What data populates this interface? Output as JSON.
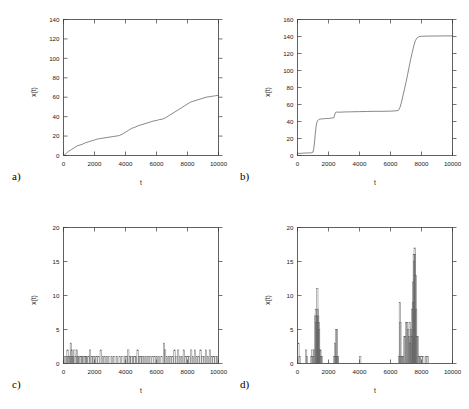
{
  "figure": {
    "panel_labels": [
      "a)",
      "b)",
      "c)",
      "d)"
    ]
  },
  "chart_data": [
    {
      "panel": "a)",
      "type": "line",
      "title": "",
      "xlabel": "t",
      "ylabel": "x(t)",
      "xlim": [
        0,
        10000
      ],
      "ylim": [
        0,
        140
      ],
      "xticks": [
        0,
        2000,
        4000,
        6000,
        8000,
        10000
      ],
      "yticks": [
        0,
        20,
        40,
        60,
        80,
        100,
        120,
        140
      ],
      "xtick_labels": [
        "0",
        "2000",
        "4000",
        "6000",
        "8000",
        "10000"
      ],
      "ytick_labels": [
        "0",
        "20",
        "40",
        "60",
        "80",
        "100",
        "120",
        "140"
      ],
      "grid": false,
      "legend": false,
      "series": [
        {
          "name": "x(t)",
          "color": "#555555",
          "x": [
            0,
            100,
            200,
            300,
            400,
            500,
            600,
            700,
            800,
            900,
            1000,
            1200,
            1400,
            1600,
            1800,
            2000,
            2200,
            2400,
            2600,
            2800,
            3000,
            3200,
            3400,
            3600,
            3800,
            4000,
            4200,
            4400,
            4600,
            4800,
            5000,
            5200,
            5400,
            5600,
            5800,
            6000,
            6200,
            6400,
            6600,
            6800,
            7000,
            7200,
            7400,
            7600,
            7800,
            8000,
            8200,
            8400,
            8600,
            8800,
            9000,
            9200,
            9400,
            9600,
            9800,
            10000
          ],
          "y": [
            0,
            1,
            2.5,
            4,
            5,
            6,
            7,
            8,
            9,
            10,
            10.5,
            11.5,
            13,
            14,
            15,
            16,
            17,
            17.5,
            18,
            18.5,
            19,
            19.5,
            20,
            20.5,
            22,
            24,
            26,
            28,
            29,
            30.5,
            31.5,
            32.5,
            33.5,
            34.5,
            35.5,
            36,
            37,
            37.5,
            39,
            41,
            43,
            45,
            47,
            49,
            51,
            53,
            55,
            56,
            57,
            58,
            59,
            60,
            60.5,
            61,
            61.5,
            62
          ]
        }
      ]
    },
    {
      "panel": "b)",
      "type": "line",
      "title": "",
      "xlabel": "t",
      "ylabel": "x(t)",
      "xlim": [
        0,
        10000
      ],
      "ylim": [
        0,
        160
      ],
      "xticks": [
        0,
        2000,
        4000,
        6000,
        8000,
        10000
      ],
      "yticks": [
        0,
        20,
        40,
        60,
        80,
        100,
        120,
        140,
        160
      ],
      "xtick_labels": [
        "0",
        "2000",
        "4000",
        "6000",
        "8000",
        "10000"
      ],
      "ytick_labels": [
        "0",
        "20",
        "40",
        "60",
        "80",
        "100",
        "120",
        "140",
        "160"
      ],
      "grid": false,
      "legend": false,
      "series": [
        {
          "name": "x(t)",
          "color": "#555555",
          "x": [
            0,
            200,
            400,
            600,
            800,
            900,
            1000,
            1050,
            1100,
            1150,
            1200,
            1250,
            1300,
            1350,
            1400,
            1450,
            1500,
            1600,
            1800,
            2000,
            2200,
            2350,
            2400,
            2450,
            2500,
            2600,
            2800,
            3000,
            3500,
            4000,
            4500,
            5000,
            5500,
            6000,
            6300,
            6500,
            6600,
            6700,
            6800,
            6900,
            7000,
            7100,
            7200,
            7300,
            7400,
            7500,
            7600,
            7700,
            7800,
            7900,
            8000,
            8200,
            8500,
            9000,
            9500,
            10000
          ],
          "y": [
            2.5,
            2.5,
            2.8,
            3,
            3,
            3.2,
            4,
            8,
            16,
            26,
            34,
            39,
            41,
            42,
            42.5,
            43,
            43,
            43,
            43.5,
            43.5,
            44,
            44.5,
            48,
            50.5,
            51,
            51,
            51,
            51.2,
            51.4,
            51.6,
            51.8,
            52,
            52,
            52.2,
            52.5,
            53,
            56,
            62,
            70,
            78,
            86,
            95,
            104,
            113,
            121,
            129,
            135,
            138,
            139.5,
            140,
            140.2,
            140.4,
            140.5,
            140.6,
            140.7,
            140.8
          ]
        }
      ]
    },
    {
      "panel": "c)",
      "type": "bar",
      "title": "",
      "xlabel": "t",
      "ylabel": "x(t)",
      "xlim": [
        0,
        10000
      ],
      "ylim": [
        0,
        20
      ],
      "xticks": [
        0,
        2000,
        4000,
        6000,
        8000,
        10000
      ],
      "yticks": [
        0,
        5,
        10,
        15,
        20
      ],
      "xtick_labels": [
        "0",
        "2000",
        "4000",
        "6000",
        "8000",
        "10000"
      ],
      "ytick_labels": [
        "0",
        "5",
        "10",
        "15",
        "20"
      ],
      "grid": false,
      "legend": false,
      "bar_color": "#5a5a5a",
      "x": [
        120,
        200,
        260,
        330,
        400,
        470,
        520,
        570,
        620,
        700,
        780,
        860,
        940,
        1020,
        1100,
        1180,
        1280,
        1360,
        1440,
        1520,
        1620,
        1720,
        1820,
        1920,
        2020,
        2140,
        2260,
        2400,
        2540,
        2660,
        2800,
        2960,
        3120,
        3280,
        3440,
        3620,
        3800,
        3980,
        4080,
        4180,
        4280,
        4380,
        4480,
        4580,
        4680,
        4780,
        4880,
        4980,
        5080,
        5200,
        5320,
        5460,
        5600,
        5740,
        5880,
        6020,
        6160,
        6320,
        6480,
        6560,
        6680,
        6800,
        6920,
        7040,
        7160,
        7280,
        7400,
        7520,
        7640,
        7760,
        7880,
        8000,
        8120,
        8240,
        8360,
        8480,
        8600,
        8720,
        8840,
        8960,
        9080,
        9200,
        9320,
        9440,
        9560,
        9680,
        9800,
        9900
      ],
      "values": [
        1,
        1,
        2,
        1,
        1,
        3,
        2,
        1,
        1,
        2,
        1,
        2,
        1,
        1,
        1,
        1,
        1,
        1,
        1,
        1,
        1,
        2,
        1,
        1,
        1,
        1,
        1,
        2,
        1,
        1,
        1,
        1,
        1,
        1,
        1,
        1,
        1,
        1,
        1,
        2,
        1,
        1,
        1,
        1,
        1,
        2,
        1,
        1,
        1,
        1,
        1,
        1,
        1,
        1,
        1,
        1,
        1,
        1,
        3,
        2,
        1,
        1,
        1,
        1,
        2,
        1,
        2,
        1,
        1,
        2,
        1,
        1,
        1,
        2,
        1,
        2,
        1,
        1,
        2,
        1,
        1,
        2,
        1,
        2,
        1,
        1,
        1,
        1
      ]
    },
    {
      "panel": "d)",
      "type": "bar",
      "title": "",
      "xlabel": "t",
      "ylabel": "x(t)",
      "xlim": [
        0,
        10000
      ],
      "ylim": [
        0,
        20
      ],
      "xticks": [
        0,
        2000,
        4000,
        6000,
        8000,
        10000
      ],
      "yticks": [
        0,
        5,
        10,
        15,
        20
      ],
      "xtick_labels": [
        "0",
        "2000",
        "4000",
        "6000",
        "8000",
        "10000"
      ],
      "ytick_labels": [
        "0",
        "5",
        "10",
        "15",
        "20"
      ],
      "grid": false,
      "legend": false,
      "bar_color": "#5a5a5a",
      "x": [
        60,
        130,
        560,
        620,
        900,
        960,
        1020,
        1080,
        1140,
        1180,
        1220,
        1250,
        1280,
        1310,
        1340,
        1370,
        1400,
        1440,
        1480,
        1520,
        1560,
        2380,
        2420,
        2460,
        2500,
        2540,
        2580,
        2620,
        4050,
        6560,
        6600,
        6640,
        6700,
        6760,
        6820,
        6900,
        6960,
        7020,
        7080,
        7140,
        7200,
        7240,
        7280,
        7320,
        7360,
        7400,
        7440,
        7470,
        7500,
        7530,
        7560,
        7590,
        7620,
        7660,
        7700,
        7760,
        7820,
        7900,
        8000,
        8120,
        8300,
        8400
      ],
      "values": [
        3,
        1,
        2,
        1,
        1,
        2,
        1,
        2,
        7,
        8,
        6,
        7,
        11,
        8,
        7,
        6,
        5,
        2,
        2,
        1,
        1,
        1,
        3,
        1,
        5,
        5,
        1,
        1,
        1,
        1,
        9,
        6,
        1,
        1,
        1,
        4,
        4,
        6,
        6,
        5,
        4,
        6,
        3,
        5,
        4,
        8,
        9,
        12,
        16,
        15,
        17,
        16,
        13,
        8,
        4,
        4,
        1,
        1,
        1,
        1,
        1,
        1
      ]
    }
  ]
}
